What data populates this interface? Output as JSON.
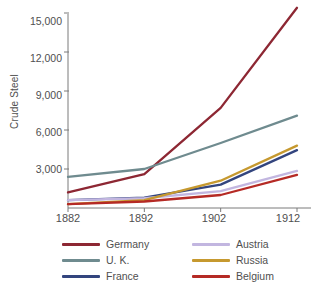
{
  "chart_data": {
    "type": "line",
    "title": "",
    "xlabel": "",
    "ylabel": "Crude Steel",
    "x": [
      1882,
      1892,
      1902,
      1912
    ],
    "xticklabels": [
      "1882",
      "1892",
      "1902",
      "1912"
    ],
    "yticks": [
      3000,
      6000,
      9000,
      12000,
      15000
    ],
    "yticklabels": [
      "3,000",
      "6,000",
      "9,000",
      "12,000",
      "15,000"
    ],
    "ylim": [
      0,
      16200
    ],
    "xlim": [
      1882,
      1912
    ],
    "grid": false,
    "legend_position": "below-axes",
    "series": [
      {
        "name": "Germany",
        "color": "#8d2733",
        "values": [
          1200,
          2600,
          7700,
          15400
        ]
      },
      {
        "name": "U. K.",
        "color": "#6f8b8f",
        "values": [
          2400,
          3000,
          5000,
          7100
        ]
      },
      {
        "name": "France",
        "color": "#33457e",
        "values": [
          600,
          800,
          1800,
          4450
        ]
      },
      {
        "name": "Austria",
        "color": "#c2b6e0",
        "values": [
          600,
          750,
          1300,
          2850
        ]
      },
      {
        "name": "Russia",
        "color": "#c6992f",
        "values": [
          300,
          600,
          2100,
          4800
        ]
      },
      {
        "name": "Belgium",
        "color": "#b52a25",
        "values": [
          300,
          500,
          1000,
          2550
        ]
      }
    ]
  },
  "legend": {
    "items": [
      {
        "label": "Germany"
      },
      {
        "label": "Austria"
      },
      {
        "label": "U. K."
      },
      {
        "label": "Russia"
      },
      {
        "label": "France"
      },
      {
        "label": "Belgium"
      }
    ]
  },
  "axes": {
    "y_title": "Crude Steel",
    "y_labels": [
      "15,000",
      "12,000",
      "9,000",
      "6,000",
      "3,000"
    ],
    "x_labels": [
      "1882",
      "1892",
      "1902",
      "1912"
    ]
  }
}
